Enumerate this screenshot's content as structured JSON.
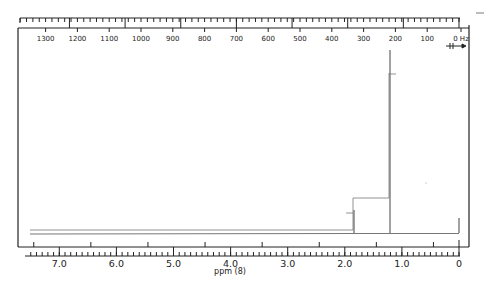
{
  "chart_data": {
    "type": "line",
    "title": "",
    "subtitle": "1H NMR spectrum",
    "xlabel": "ppm (δ)",
    "xlabel_display": "ppm (8)",
    "ylabel": "",
    "xlim": [
      7.5,
      0
    ],
    "x_ticks_ppm": [
      "7.0",
      "6.0",
      "5.0",
      "4.0",
      "3.0",
      "2.0",
      "1.0",
      "0"
    ],
    "top_axis_unit": "Hz",
    "top_axis_ticks_hz": [
      "1300",
      "1200",
      "1100",
      "1000",
      "900",
      "800",
      "700",
      "600",
      "500",
      "400",
      "300",
      "200",
      "100",
      "0 Hz"
    ],
    "grid": false,
    "legend": null,
    "annotations": [
      "sweep-offset arrow (→) under 0 Hz"
    ],
    "series": [
      {
        "name": "spectrum",
        "peaks": [
          {
            "ppm": 1.85,
            "relative_height": 0.14
          },
          {
            "ppm": 1.22,
            "relative_height": 1.0
          },
          {
            "ppm": 0.0,
            "relative_height": 0.09,
            "label": "TMS reference"
          }
        ]
      },
      {
        "name": "integration",
        "steps": [
          {
            "ppm": 1.85,
            "relative_step": 0.2
          },
          {
            "ppm": 1.22,
            "relative_step": 0.8
          }
        ]
      }
    ]
  },
  "labels": {
    "hz": [
      "1300",
      "1200",
      "1100",
      "1000",
      "900",
      "800",
      "700",
      "600",
      "500",
      "400",
      "300",
      "200",
      "100",
      "0 Hz"
    ],
    "ppm": [
      "7.0",
      "6.0",
      "5.0",
      "4.0",
      "3.0",
      "2.0",
      "1.0",
      "0"
    ],
    "xlabel": "ppm (8)"
  },
  "colors": {
    "ink": "#222222",
    "trace": "#555555",
    "background": "#ffffff"
  }
}
